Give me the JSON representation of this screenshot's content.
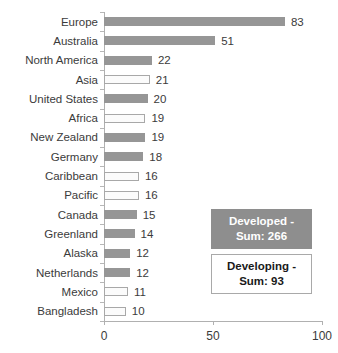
{
  "chart_data": {
    "type": "bar",
    "orientation": "horizontal",
    "title": "",
    "xlabel": "",
    "ylabel": "",
    "xlim": [
      0,
      100
    ],
    "xticks": [
      0,
      50,
      100
    ],
    "xtick_labels": [
      "0",
      "50",
      "100"
    ],
    "grid": false,
    "categories": [
      "Europe",
      "Australia",
      "North America",
      "Asia",
      "United States",
      "Africa",
      "New Zealand",
      "Germany",
      "Caribbean",
      "Pacific",
      "Canada",
      "Greenland",
      "Alaska",
      "Netherlands",
      "Mexico",
      "Bangladesh"
    ],
    "values": [
      83,
      51,
      22,
      21,
      20,
      19,
      19,
      18,
      16,
      16,
      15,
      14,
      12,
      12,
      11,
      10
    ],
    "value_labels": [
      "83",
      "51",
      "22",
      "21",
      "20",
      "19",
      "19",
      "18",
      "16",
      "16",
      "15",
      "14",
      "12",
      "12",
      "11",
      "10"
    ],
    "groups": [
      "developed",
      "developed",
      "developed",
      "developing",
      "developed",
      "developing",
      "developed",
      "developed",
      "developing",
      "developing",
      "developed",
      "developed",
      "developed",
      "developed",
      "developing",
      "developing"
    ],
    "series": [
      {
        "name": "Developed",
        "color": "#969696",
        "sum": 266
      },
      {
        "name": "Developing",
        "color": "#ffffff",
        "border_color": "#a8a8a8",
        "sum": 93
      }
    ],
    "legend_position": "inside-right-lower"
  },
  "legend": {
    "developed": {
      "line1": "Developed -",
      "line2": "Sum: 266"
    },
    "developing": {
      "line1": "Developing -",
      "line2": "Sum: 93"
    }
  },
  "colors": {
    "developed_fill": "#969696",
    "developing_fill": "#ffffff",
    "developing_border": "#a8a8a8",
    "axis": "#b0b0b0",
    "text": "#3b3b3b",
    "legend_developed_bg": "#8e8e8e",
    "legend_developed_text": "#ffffff",
    "legend_developing_text": "#1a1a1a"
  }
}
